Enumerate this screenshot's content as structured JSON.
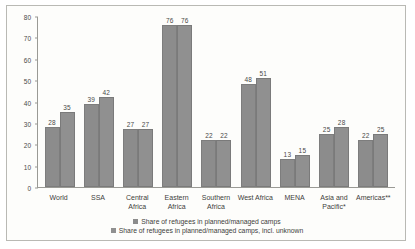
{
  "chart_data": {
    "type": "bar",
    "title": "",
    "xlabel": "",
    "ylabel": "",
    "ylim": [
      0,
      80
    ],
    "ytick_step": 10,
    "yticks": [
      0,
      10,
      20,
      30,
      40,
      50,
      60,
      70,
      80
    ],
    "grid": false,
    "legend_position": "bottom",
    "categories": [
      "World",
      "SSA",
      "Central Africa",
      "Eastern Africa",
      "Southern Africa",
      "West Africa",
      "MENA",
      "Asia and Pacific*",
      "Americas**"
    ],
    "series": [
      {
        "name": "Share of refugees in planned/managed camps",
        "color": "#8c8c8c",
        "values": [
          28,
          39,
          27,
          76,
          22,
          48,
          13,
          25,
          22
        ]
      },
      {
        "name": "Share of refugees in planned/managed camps, incl. unknown",
        "color": "#909090",
        "values": [
          35,
          42,
          27,
          76,
          22,
          51,
          15,
          28,
          25
        ]
      }
    ]
  },
  "legend": {
    "items": [
      "Share of refugees in planned/managed camps",
      "Share of refugees in planned/managed camps, incl. unknown"
    ]
  }
}
